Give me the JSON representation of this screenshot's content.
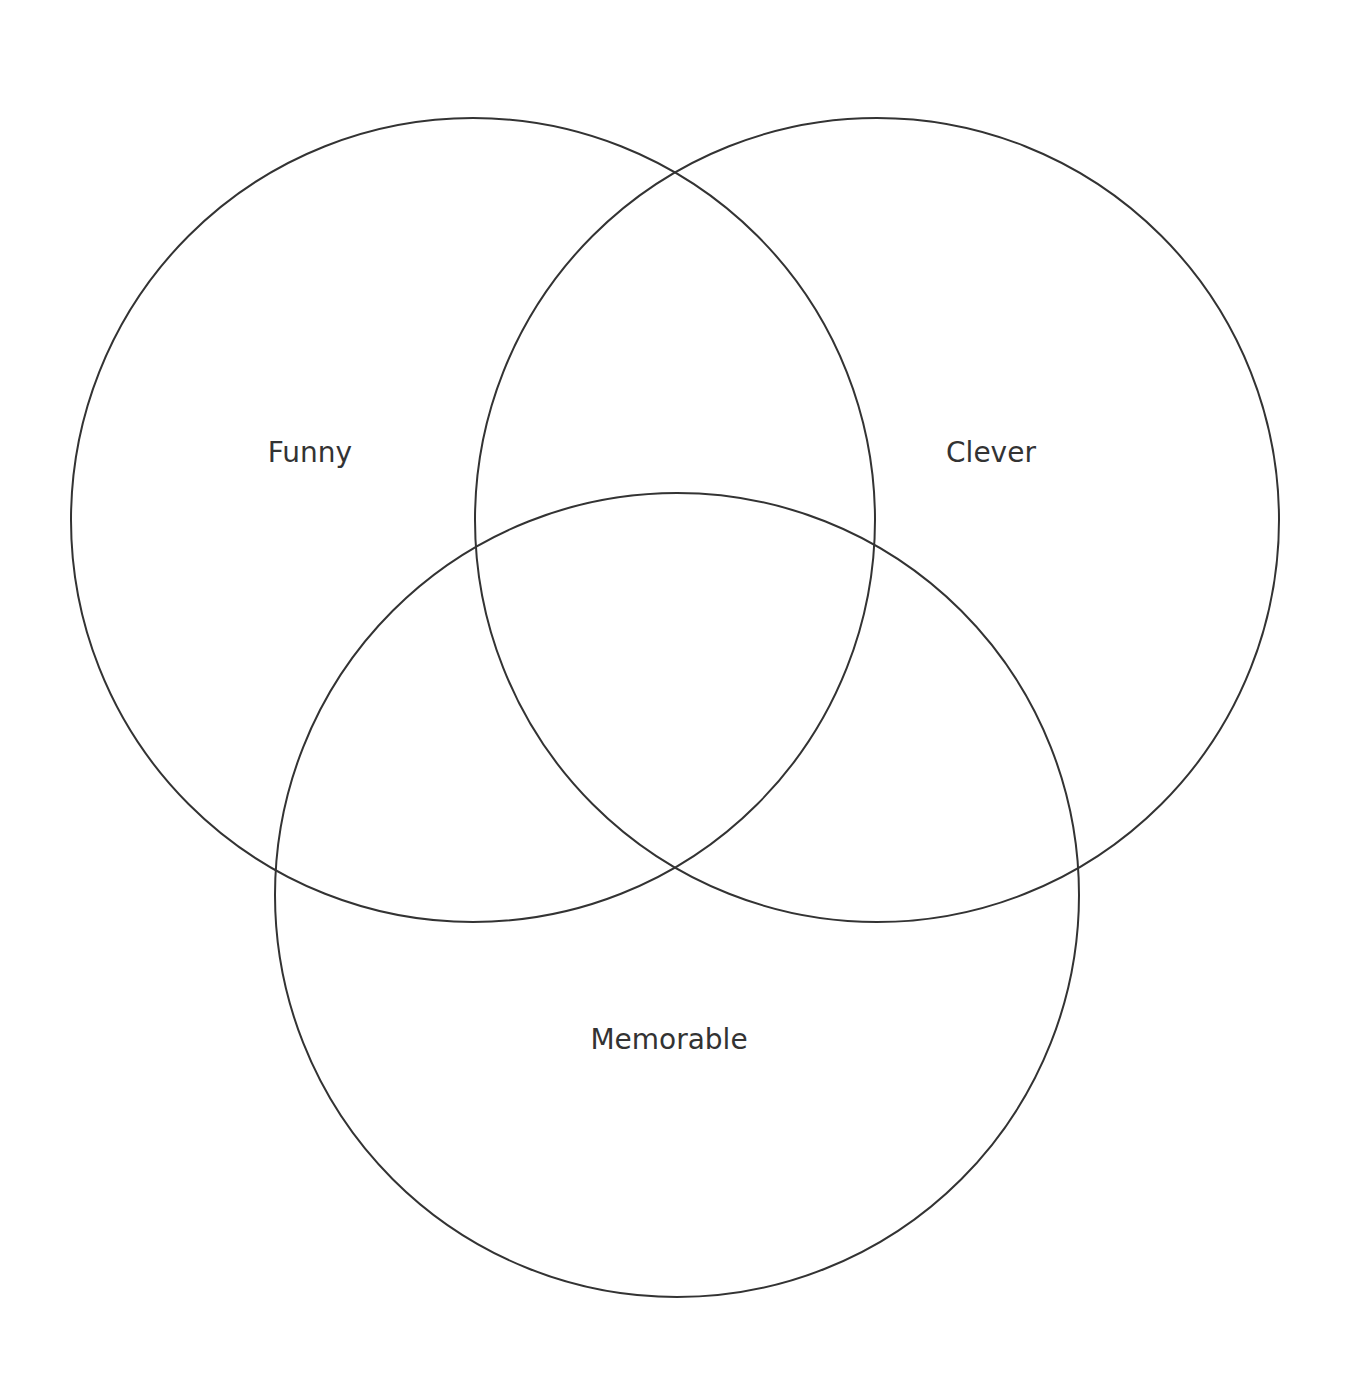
{
  "diagram": {
    "type": "venn",
    "sets": [
      {
        "label": "Funny",
        "cx": 473,
        "cy": 520,
        "r": 402,
        "label_x": 310,
        "label_y": 462
      },
      {
        "label": "Clever",
        "cx": 877,
        "cy": 520,
        "r": 402,
        "label_x": 991,
        "label_y": 462
      },
      {
        "label": "Memorable",
        "cx": 677,
        "cy": 895,
        "r": 402,
        "label_x": 669,
        "label_y": 1049
      }
    ],
    "stroke_color": "#333333",
    "background": "#ffffff"
  }
}
